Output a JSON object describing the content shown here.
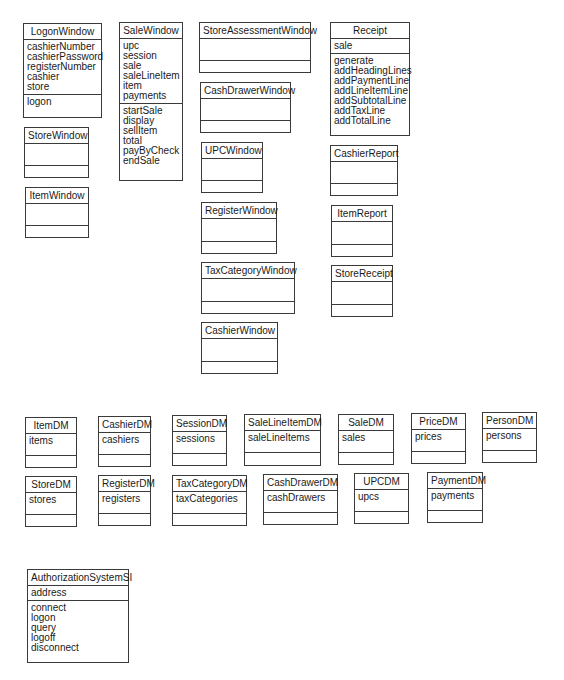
{
  "diagram": {
    "classes": [
      {
        "id": "logon-window",
        "name": "LogonWindow",
        "x": 23,
        "y": 23,
        "w": 79,
        "h": 95,
        "attributes": [
          "cashierNumber",
          "cashierPassword",
          "registerNumber",
          "cashier",
          "store"
        ],
        "operations": [
          "logon"
        ]
      },
      {
        "id": "store-window",
        "name": "StoreWindow",
        "x": 24,
        "y": 127,
        "w": 65,
        "h": 51,
        "attributes": [],
        "operations": []
      },
      {
        "id": "item-window",
        "name": "ItemWindow",
        "x": 25,
        "y": 187,
        "w": 64,
        "h": 51,
        "attributes": [],
        "operations": []
      },
      {
        "id": "sale-window",
        "name": "SaleWindow",
        "x": 119,
        "y": 22,
        "w": 64,
        "h": 159,
        "attributes": [
          "upc",
          "session",
          "sale",
          "saleLineItem",
          "item",
          "payments"
        ],
        "operations": [
          "startSale",
          "display",
          "sellItem",
          "total",
          "payByCheck",
          "endSale"
        ]
      },
      {
        "id": "store-assessment-window",
        "name": "StoreAssessmentWindow",
        "x": 199,
        "y": 22,
        "w": 112,
        "h": 51,
        "attributes": [],
        "operations": []
      },
      {
        "id": "cash-drawer-window",
        "name": "CashDrawerWindow",
        "x": 200,
        "y": 82,
        "w": 91,
        "h": 51,
        "attributes": [],
        "operations": []
      },
      {
        "id": "upc-window",
        "name": "UPCWindow",
        "x": 201,
        "y": 142,
        "w": 62,
        "h": 51,
        "attributes": [],
        "operations": []
      },
      {
        "id": "register-window",
        "name": "RegisterWindow",
        "x": 201,
        "y": 202,
        "w": 76,
        "h": 52,
        "attributes": [],
        "operations": []
      },
      {
        "id": "tax-category-window",
        "name": "TaxCategoryWindow",
        "x": 201,
        "y": 262,
        "w": 94,
        "h": 52,
        "attributes": [],
        "operations": []
      },
      {
        "id": "cashier-window",
        "name": "CashierWindow",
        "x": 201,
        "y": 322,
        "w": 77,
        "h": 52,
        "attributes": [],
        "operations": []
      },
      {
        "id": "receipt",
        "name": "Receipt",
        "x": 330,
        "y": 22,
        "w": 80,
        "h": 114,
        "attributes": [
          "sale"
        ],
        "operations": [
          "generate",
          "addHeadingLines",
          "addPaymentLine",
          "addLineItemLine",
          "addSubtotalLine",
          "addTaxLine",
          "addTotalLine"
        ]
      },
      {
        "id": "cashier-report",
        "name": "CashierReport",
        "x": 330,
        "y": 145,
        "w": 68,
        "h": 51,
        "attributes": [],
        "operations": []
      },
      {
        "id": "item-report",
        "name": "ItemReport",
        "x": 331,
        "y": 205,
        "w": 62,
        "h": 52,
        "attributes": [],
        "operations": []
      },
      {
        "id": "store-receipt",
        "name": "StoreReceipt",
        "x": 331,
        "y": 265,
        "w": 62,
        "h": 52,
        "attributes": [],
        "operations": []
      },
      {
        "id": "item-dm",
        "name": "ItemDM",
        "x": 25,
        "y": 417,
        "w": 52,
        "h": 51,
        "attributes": [
          "items"
        ],
        "operations": []
      },
      {
        "id": "cashier-dm",
        "name": "CashierDM",
        "x": 98,
        "y": 416,
        "w": 53,
        "h": 51,
        "attributes": [
          "cashiers"
        ],
        "operations": []
      },
      {
        "id": "session-dm",
        "name": "SessionDM",
        "x": 172,
        "y": 415,
        "w": 55,
        "h": 51,
        "attributes": [
          "sessions"
        ],
        "operations": []
      },
      {
        "id": "sale-line-item-dm",
        "name": "SaleLineItemDM",
        "x": 244,
        "y": 414,
        "w": 77,
        "h": 52,
        "attributes": [
          "saleLineItems"
        ],
        "operations": []
      },
      {
        "id": "sale-dm",
        "name": "SaleDM",
        "x": 338,
        "y": 414,
        "w": 56,
        "h": 51,
        "attributes": [
          "sales"
        ],
        "operations": []
      },
      {
        "id": "price-dm",
        "name": "PriceDM",
        "x": 411,
        "y": 413,
        "w": 55,
        "h": 51,
        "attributes": [
          "prices"
        ],
        "operations": []
      },
      {
        "id": "person-dm",
        "name": "PersonDM",
        "x": 482,
        "y": 412,
        "w": 55,
        "h": 51,
        "attributes": [
          "persons"
        ],
        "operations": []
      },
      {
        "id": "store-dm",
        "name": "StoreDM",
        "x": 25,
        "y": 476,
        "w": 52,
        "h": 51,
        "attributes": [
          "stores"
        ],
        "operations": []
      },
      {
        "id": "register-dm",
        "name": "RegisterDM",
        "x": 98,
        "y": 475,
        "w": 53,
        "h": 51,
        "attributes": [
          "registers"
        ],
        "operations": []
      },
      {
        "id": "tax-category-dm",
        "name": "TaxCategoryDM",
        "x": 172,
        "y": 475,
        "w": 75,
        "h": 51,
        "attributes": [
          "taxCategories"
        ],
        "operations": []
      },
      {
        "id": "cash-drawer-dm",
        "name": "CashDrawerDM",
        "x": 263,
        "y": 474,
        "w": 75,
        "h": 51,
        "attributes": [
          "cashDrawers"
        ],
        "operations": []
      },
      {
        "id": "upc-dm",
        "name": "UPCDM",
        "x": 354,
        "y": 473,
        "w": 55,
        "h": 51,
        "attributes": [
          "upcs"
        ],
        "operations": []
      },
      {
        "id": "payment-dm",
        "name": "PaymentDM",
        "x": 427,
        "y": 472,
        "w": 56,
        "h": 51,
        "attributes": [
          "payments"
        ],
        "operations": []
      },
      {
        "id": "authorization-system-si",
        "name": "AuthorizationSystemSI",
        "x": 27,
        "y": 569,
        "w": 102,
        "h": 94,
        "attributes": [
          "address"
        ],
        "operations": [
          "connect",
          "logon",
          "query",
          "logoff",
          "disconnect"
        ]
      }
    ]
  }
}
